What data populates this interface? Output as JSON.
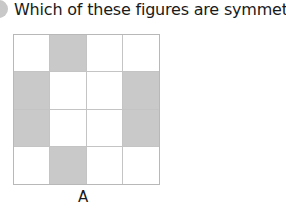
{
  "question": {
    "text": "Which of these figures are symmetric?"
  },
  "figure": {
    "label": "A",
    "rows": 4,
    "cols": 4,
    "shaded_color": "#c9c9c9",
    "cells": [
      [
        0,
        1,
        0,
        0
      ],
      [
        1,
        0,
        0,
        1
      ],
      [
        1,
        0,
        0,
        1
      ],
      [
        0,
        1,
        0,
        0
      ]
    ]
  }
}
